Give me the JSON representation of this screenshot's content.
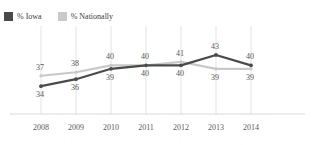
{
  "title_clipped": "",
  "legend": {
    "items": [
      {
        "label": "% Iowa",
        "color": "#4a4a4a",
        "icon": "square-swatch-icon"
      },
      {
        "label": "% Nationally",
        "color": "#c9c9c9",
        "icon": "square-swatch-icon"
      }
    ]
  },
  "chart_data": {
    "type": "line",
    "title": "",
    "xlabel": "",
    "ylabel": "",
    "categories": [
      "2008",
      "2009",
      "2010",
      "2011",
      "2012",
      "2013",
      "2014"
    ],
    "ylim": [
      30,
      45
    ],
    "grid": "vertical",
    "legend_position": "top-left",
    "data_labels": true,
    "series": [
      {
        "name": "% Iowa",
        "color": "#4a4a4a",
        "values": [
          34,
          36,
          39,
          40,
          40,
          43,
          40
        ],
        "label_positions": [
          "below",
          "below",
          "below",
          "below",
          "below",
          "above",
          "above"
        ]
      },
      {
        "name": "% Nationally",
        "color": "#c9c9c9",
        "values": [
          37,
          38,
          40,
          40,
          41,
          39,
          39
        ],
        "label_positions": [
          "above",
          "above",
          "above",
          "above",
          "above",
          "below",
          "below"
        ]
      }
    ]
  },
  "axis": {
    "baseline_color": "#d9d9d9",
    "gridline_color": "#dcdcdc"
  }
}
